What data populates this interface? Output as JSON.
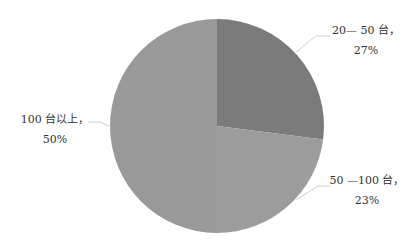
{
  "chart_data": {
    "type": "pie",
    "title": "",
    "start_angle_deg": 0,
    "direction": "clockwise",
    "slices": [
      {
        "label": "20—50 台",
        "value": 27,
        "pct_text": "27%",
        "color": "#7b7b7b"
      },
      {
        "label": "50—100 台",
        "value": 23,
        "pct_text": "23%",
        "color": "#9c9c9c"
      },
      {
        "label": "100 台以上",
        "value": 50,
        "pct_text": "50%",
        "color": "#999999"
      }
    ],
    "legend": "none",
    "data_labels": "outside with leader lines"
  },
  "labels": {
    "s0_line1": "20— 50 台，",
    "s0_line2": "27%",
    "s1_line1": "50 —100 台，",
    "s1_line2": "23%",
    "s2_line1": "100 台以上，",
    "s2_line2": "50%"
  }
}
